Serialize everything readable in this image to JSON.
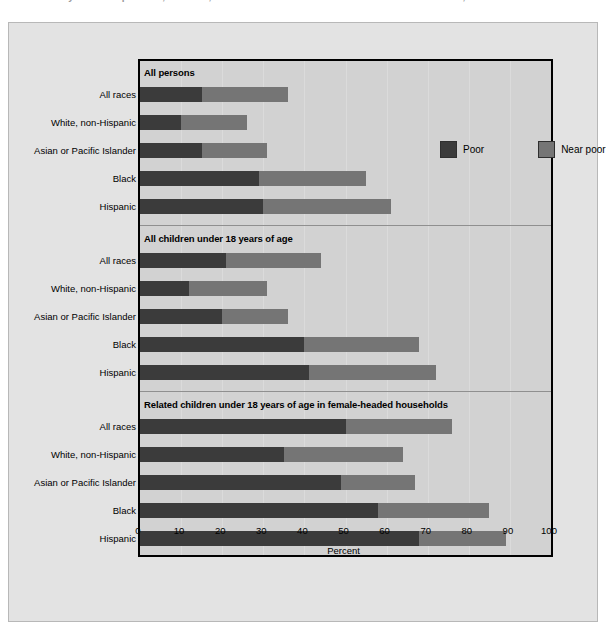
{
  "figure": {
    "clipped_title": "Poverty rates for persons, children, and related children in female-headed households, 1999",
    "xaxis_title": "Percent",
    "background_color": "#e3e3e3",
    "plot_background_color": "#d2d2d2"
  },
  "legend": {
    "position": "top-right-inside",
    "items": [
      {
        "label": "Poor",
        "color": "#3b3b3b",
        "name": "legend-swatch-poor"
      },
      {
        "label": "Near poor",
        "color": "#757575",
        "name": "legend-swatch-near-poor"
      }
    ]
  },
  "chart_data": {
    "type": "bar",
    "orientation": "horizontal",
    "stacked": true,
    "title": "Poverty rates for persons, children, and related children in female-headed households, 1999",
    "xlabel": "Percent",
    "ylabel": "",
    "xlim": [
      0,
      100
    ],
    "xticks": [
      0,
      10,
      20,
      30,
      40,
      50,
      60,
      70,
      80,
      90,
      100
    ],
    "grid": true,
    "legend": [
      "Poor",
      "Near poor"
    ],
    "categories": [
      "All races",
      "White, non-Hispanic",
      "Asian or Pacific Islander",
      "Black",
      "Hispanic"
    ],
    "panels": [
      {
        "title": "All persons",
        "rows": [
          {
            "category": "All races",
            "poor": 15,
            "near_poor": 21,
            "total": 36
          },
          {
            "category": "White, non-Hispanic",
            "poor": 10,
            "near_poor": 16,
            "total": 26
          },
          {
            "category": "Asian or Pacific Islander",
            "poor": 15,
            "near_poor": 16,
            "total": 31
          },
          {
            "category": "Black",
            "poor": 29,
            "near_poor": 26,
            "total": 55
          },
          {
            "category": "Hispanic",
            "poor": 30,
            "near_poor": 31,
            "total": 61
          }
        ]
      },
      {
        "title": "All children under 18 years of age",
        "rows": [
          {
            "category": "All races",
            "poor": 21,
            "near_poor": 23,
            "total": 44
          },
          {
            "category": "White, non-Hispanic",
            "poor": 12,
            "near_poor": 19,
            "total": 31
          },
          {
            "category": "Asian or Pacific Islander",
            "poor": 20,
            "near_poor": 16,
            "total": 36
          },
          {
            "category": "Black",
            "poor": 40,
            "near_poor": 28,
            "total": 68
          },
          {
            "category": "Hispanic",
            "poor": 41,
            "near_poor": 31,
            "total": 72
          }
        ]
      },
      {
        "title": "Related children under 18 years of age in female-headed households",
        "rows": [
          {
            "category": "All races",
            "poor": 50,
            "near_poor": 26,
            "total": 76
          },
          {
            "category": "White, non-Hispanic",
            "poor": 35,
            "near_poor": 29,
            "total": 64
          },
          {
            "category": "Asian or Pacific Islander",
            "poor": 49,
            "near_poor": 18,
            "total": 67
          },
          {
            "category": "Black",
            "poor": 58,
            "near_poor": 27,
            "total": 85
          },
          {
            "category": "Hispanic",
            "poor": 68,
            "near_poor": 21,
            "total": 89
          }
        ]
      }
    ],
    "colors": {
      "poor": "#3b3b3b",
      "near_poor": "#757575"
    }
  }
}
